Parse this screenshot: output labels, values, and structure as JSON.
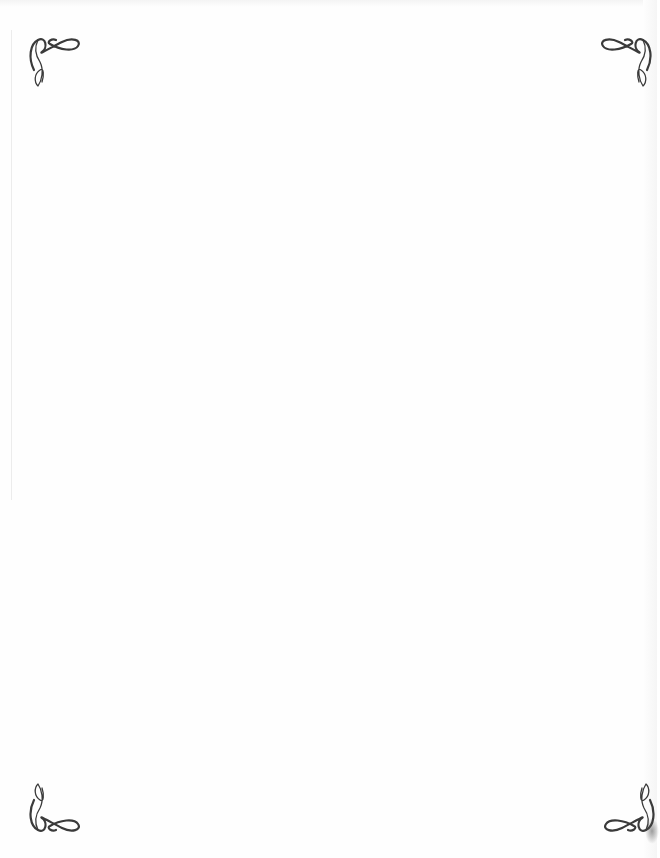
{
  "page": {
    "background_color": "#fefefe",
    "ornament_color": "#3a3a3a",
    "body_text": ""
  },
  "ornaments": [
    {
      "position": "top-left",
      "icon": "flourish-corner-icon"
    },
    {
      "position": "top-right",
      "icon": "flourish-corner-icon"
    },
    {
      "position": "bottom-left",
      "icon": "flourish-corner-icon"
    },
    {
      "position": "bottom-right",
      "icon": "flourish-corner-icon"
    }
  ]
}
